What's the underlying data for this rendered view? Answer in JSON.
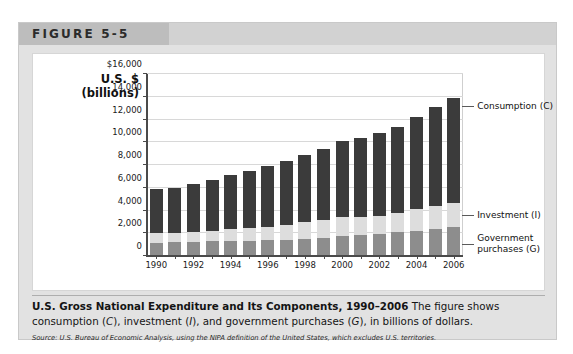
{
  "figure": {
    "number_label": "FIGURE 5-5"
  },
  "axis_title": {
    "line1": "U.S. $",
    "line2": "(billions)"
  },
  "callouts": {
    "consumption": "Consumption (C)",
    "investment": "Investment (I)",
    "government_line1": "Government",
    "government_line2": "purchases (G)"
  },
  "caption": {
    "title": "U.S. Gross National Expenditure and Its Components, 1990–2006",
    "body_1": " The figure shows consumption (",
    "body_c": "C",
    "body_2": "), investment (",
    "body_i": "I",
    "body_3": "), and government purchases (",
    "body_g": "G",
    "body_4": "), in billions of dollars.",
    "source": "Source: U.S. Bureau of Economic Analysis, using the NIPA definition of the United States, which excludes U.S. territories."
  },
  "colors": {
    "consumption": "#3b3b3b",
    "investment": "#dddddd",
    "government": "#8d8d8d",
    "gridline": "#d8d8d8",
    "axis": "#4a4a4a",
    "header_band": "#bdbdbd",
    "frame": "#e2e2e2"
  },
  "chart_data": {
    "type": "bar",
    "stacked": true,
    "title": "U.S. Gross National Expenditure and Its Components, 1990–2006",
    "xlabel": "",
    "ylabel": "U.S. $ (billions)",
    "ylim": [
      0,
      16000
    ],
    "ytick_values": [
      0,
      2000,
      4000,
      6000,
      8000,
      10000,
      12000,
      14000,
      16000
    ],
    "ytick_labels": [
      "0",
      "2,000",
      "4,000",
      "6,000",
      "8,000",
      "10,000",
      "12,000",
      "14,000",
      "$16,000"
    ],
    "grid": true,
    "legend_position": "right-callouts",
    "categories": [
      1990,
      1991,
      1992,
      1993,
      1994,
      1995,
      1996,
      1997,
      1998,
      1999,
      2000,
      2001,
      2002,
      2003,
      2004,
      2005,
      2006
    ],
    "xtick_labels": [
      "1990",
      "1992",
      "1994",
      "1996",
      "1998",
      "2000",
      "2002",
      "2004",
      "2006"
    ],
    "series": [
      {
        "name": "Government purchases (G)",
        "key": "government",
        "values": [
          1180,
          1230,
          1270,
          1290,
          1320,
          1360,
          1400,
          1450,
          1530,
          1620,
          1720,
          1820,
          1960,
          2080,
          2220,
          2360,
          2510
        ]
      },
      {
        "name": "Investment (I)",
        "key": "investment",
        "values": [
          820,
          760,
          820,
          900,
          1030,
          1080,
          1180,
          1320,
          1430,
          1550,
          1730,
          1580,
          1570,
          1660,
          1870,
          2060,
          2160
        ]
      },
      {
        "name": "Consumption (C)",
        "key": "consumption",
        "values": [
          3900,
          4010,
          4280,
          4520,
          4760,
          5030,
          5300,
          5600,
          5880,
          6280,
          6660,
          7010,
          7280,
          7620,
          8130,
          8650,
          9220
        ]
      }
    ],
    "totals": [
      5900,
      6000,
      6370,
      6710,
      7110,
      7470,
      7880,
      8370,
      8840,
      9450,
      10110,
      10410,
      10810,
      11360,
      12220,
      13070,
      13890
    ]
  }
}
